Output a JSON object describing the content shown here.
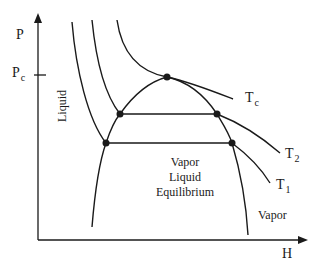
{
  "diagram": {
    "type": "P-H phase diagram",
    "axes": {
      "y_label": "P",
      "x_label": "H",
      "y_tick": {
        "main": "P",
        "sub": "c"
      }
    },
    "regions": {
      "liquid": "Liquid",
      "vle_line1": "Vapor",
      "vle_line2": "Liquid",
      "vle_line3": "Equilibrium",
      "vapor": "Vapor"
    },
    "isotherms": [
      {
        "main": "T",
        "sub": "c"
      },
      {
        "main": "T",
        "sub": "2"
      },
      {
        "main": "T",
        "sub": "1"
      }
    ],
    "colors": {
      "line": "#1a1a1a",
      "background": "#ffffff"
    }
  }
}
